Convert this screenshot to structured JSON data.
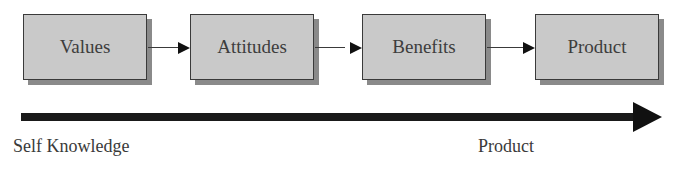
{
  "diagram": {
    "nodes": [
      {
        "id": "values",
        "label": "Values"
      },
      {
        "id": "attitudes",
        "label": "Attitudes"
      },
      {
        "id": "benefits",
        "label": "Benefits"
      },
      {
        "id": "product",
        "label": "Product"
      }
    ],
    "edges": [
      {
        "from": "values",
        "to": "attitudes"
      },
      {
        "from": "attitudes",
        "to": "benefits"
      },
      {
        "from": "benefits",
        "to": "product"
      }
    ],
    "axis": {
      "start_label": "Self Knowledge",
      "end_label": "Product"
    }
  },
  "colors": {
    "box_fill": "#c9c9c9",
    "box_border": "#3a3a3a",
    "box_shadow": "#8a8a8a",
    "arrow": "#111111"
  }
}
